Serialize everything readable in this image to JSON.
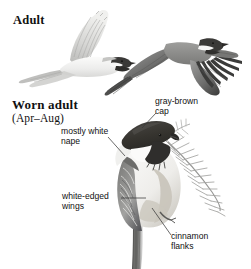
{
  "plate": {
    "subject": "Black-capped Chickadee plate",
    "background_color": "#ffffff",
    "ink_color": "#111111",
    "leader_line_color": "#3a3a3a"
  },
  "headings": {
    "adult": "Adult",
    "worn_adult": "Worn adult",
    "worn_adult_season": "(Apr–Aug)"
  },
  "callouts": {
    "cap": "gray-brown\ncap",
    "nape": "mostly white\nnape",
    "wings": "white-edged\nwings",
    "flanks": "cinnamon\nflanks"
  },
  "figures": [
    {
      "name": "adult-in-flight-underside",
      "label": "Adult",
      "pose": "flying, viewed from side/below, one wing raised"
    },
    {
      "name": "adult-in-flight-topside",
      "label": "Adult",
      "pose": "flying, viewed from above, both wings spread"
    },
    {
      "name": "worn-adult-perched",
      "label": "Worn adult",
      "pose": "perched on conifer sprig, facing right"
    }
  ],
  "plumage_colors": {
    "cap": "#3b3a38",
    "bib": "#2f2e2c",
    "cheek": "#fbfbfb",
    "nape": "#f2f2f0",
    "wing": "#8d8d8b",
    "wing_edge": "#e8e8e6",
    "flank": "#c9c6bf",
    "belly": "#f4f3f1",
    "tail": "#6f6f6d",
    "conifer": "#9a9a98"
  }
}
